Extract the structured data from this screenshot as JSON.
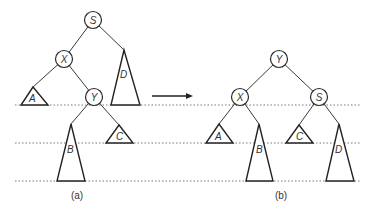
{
  "diagram": {
    "arrow": "→",
    "left": {
      "caption": "(a)",
      "nodes": {
        "root": "S",
        "left": "X",
        "leftright": "Y"
      },
      "subtrees": {
        "a": "A",
        "b": "B",
        "c": "C",
        "d": "D"
      }
    },
    "right": {
      "caption": "(b)",
      "nodes": {
        "root": "Y",
        "left": "X",
        "right": "S"
      },
      "subtrees": {
        "a": "A",
        "b": "B",
        "c": "C",
        "d": "D"
      }
    },
    "level_lines": 3
  }
}
